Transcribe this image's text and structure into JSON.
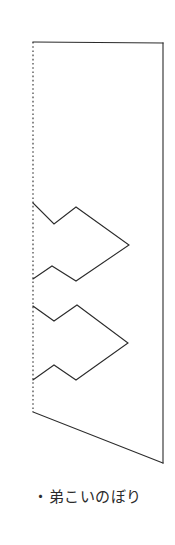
{
  "document": {
    "background_color": "#ffffff",
    "ink_color": "#2b2b2b",
    "caption": "・弟こいのぼり",
    "caption_bullet": "・",
    "caption_label": "弟こいのぼり"
  },
  "figure": {
    "name": "koinobori-cut-pattern",
    "stroke_color": "#2b2b2b",
    "fill_color": "#ffffff",
    "solid_stroke_width": 1.1,
    "fold_stroke_width": 1.1,
    "fold_dash_pattern": "1.6 2.6",
    "outline_points": "33,42 163,43 163,463 33,412",
    "fold_line": {
      "name": "fold-line",
      "style": "dotted",
      "x1": 33,
      "y1": 42,
      "x2": 33,
      "y2": 412
    },
    "body_edges": [
      {
        "name": "top-edge",
        "x1": 33,
        "y1": 42,
        "x2": 163,
        "y2": 43
      },
      {
        "name": "right-edge",
        "x1": 163,
        "y1": 43,
        "x2": 163,
        "y2": 463
      },
      {
        "name": "bottom-diagonal-edge",
        "x1": 33,
        "y1": 412,
        "x2": 163,
        "y2": 463
      }
    ],
    "carps": [
      {
        "name": "carp-upper",
        "points": "33,203 54,224 76,207 129,245 76,281 52,266 33,279"
      },
      {
        "name": "carp-lower",
        "points": "33,306 54,321 77,305 128,343 76,380 54,365 33,380"
      }
    ]
  }
}
